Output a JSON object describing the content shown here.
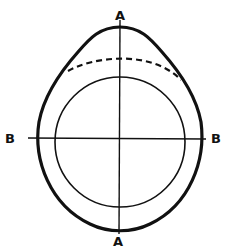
{
  "diagram": {
    "type": "cross-section",
    "labels": {
      "top_a": "A",
      "bottom_a": "A",
      "left_b": "B",
      "right_b": "B"
    },
    "axes": [
      {
        "name": "A-A",
        "orientation": "vertical"
      },
      {
        "name": "B-B",
        "orientation": "horizontal"
      }
    ],
    "shapes": [
      {
        "name": "outer-profile",
        "style": "thick solid",
        "form": "teardrop / pointed top"
      },
      {
        "name": "inner-circle",
        "style": "thin solid",
        "form": "circle"
      },
      {
        "name": "dashed-arc",
        "style": "dashed",
        "form": "arc near top between outer and inner"
      }
    ],
    "colors": {
      "line": "#111111",
      "background": "#ffffff"
    }
  }
}
